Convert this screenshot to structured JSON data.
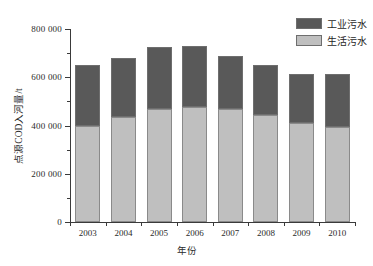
{
  "chart_data": {
    "type": "bar",
    "subtype": "stacked-vertical-bar",
    "title": "",
    "xlabel": "年份",
    "ylabel": "点源COD入河量/t",
    "categories": [
      "2003",
      "2004",
      "2005",
      "2006",
      "2007",
      "2008",
      "2009",
      "2010"
    ],
    "series": [
      {
        "name": "生活污水",
        "color": "#bfbfbf",
        "values": [
          400000,
          435000,
          470000,
          478000,
          468000,
          445000,
          410000,
          395000
        ]
      },
      {
        "name": "工业污水",
        "color": "#595959",
        "values": [
          250000,
          246000,
          255000,
          252000,
          222000,
          205000,
          205000,
          220000
        ]
      }
    ],
    "totals": [
      650000,
      681000,
      725000,
      730000,
      690000,
      650000,
      615000,
      615000
    ],
    "ylim": [
      0,
      800000
    ],
    "ytick_major": [
      0,
      200000,
      400000,
      600000,
      800000
    ],
    "ytick_major_labels": [
      "0",
      "200 000",
      "400 000",
      "600 000",
      "800 000"
    ],
    "ytick_minor": [
      100000,
      300000,
      500000,
      700000
    ],
    "grid": false,
    "legend_position": "top-right",
    "stack_order": [
      "生活污水",
      "工业污水"
    ]
  },
  "legend": {
    "entries": [
      {
        "label": "工业污水",
        "color": "#595959"
      },
      {
        "label": "生活污水",
        "color": "#bfbfbf"
      }
    ]
  },
  "axes": {
    "x_title": "年份",
    "y_title": "点源COD入河量/t"
  }
}
